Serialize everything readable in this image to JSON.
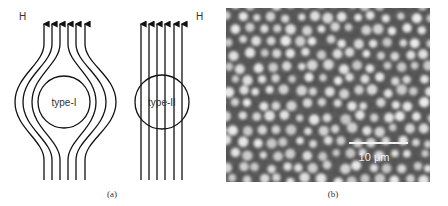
{
  "figure": {
    "panel_a": {
      "caption": "(a)",
      "left_diagram": {
        "field_label": "H",
        "circle_label": "type-I",
        "description": "Field lines bend around the sample (flux expelled)"
      },
      "right_diagram": {
        "field_label": "H",
        "circle_label": "type-II",
        "description": "Field lines pass straight through the sample"
      }
    },
    "panel_b": {
      "caption": "(b)",
      "scale_bar_label": "10 μm",
      "description": "Micrograph of vortex lattice: bright spots on dark background"
    }
  },
  "colors": {
    "line": "#1a1a1a",
    "text": "#333333",
    "micrograph_bg": "#4e4e4e",
    "micrograph_dot": "#e6e6e6",
    "scale_bar": "#f2f2f2"
  }
}
